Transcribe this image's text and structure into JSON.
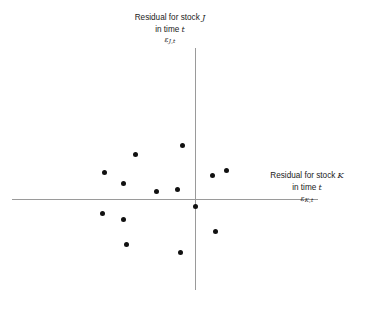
{
  "figure": {
    "type": "scatter",
    "background_color": "#ffffff",
    "axis_color": "#9a9a9a",
    "point_color": "#111111"
  },
  "y_axis": {
    "title_line1": "Residual for stock",
    "title_line1_italic": "J",
    "title_line2": "in time",
    "title_line2_italic": "t",
    "symbol": "ε",
    "symbol_subscript_stock": "J",
    "symbol_subscript_time": "t"
  },
  "x_axis": {
    "title_line1": "Residual for stock",
    "title_line1_italic": "K",
    "title_line2": "in time",
    "title_line2_italic": "t",
    "symbol": "ε",
    "symbol_subscript_stock": "K",
    "symbol_subscript_time": "t"
  },
  "chart_data": {
    "type": "scatter",
    "title": "",
    "xlabel": "Residual for stock K in time t",
    "ylabel": "Residual for stock J in time t",
    "xlim": [
      -1,
      1
    ],
    "ylim": [
      -1,
      1
    ],
    "grid": false,
    "legend": null,
    "axes_origin_px": [
      195,
      199
    ],
    "n_points": 13,
    "points_px": [
      [
        135,
        154
      ],
      [
        104,
        172
      ],
      [
        123,
        183
      ],
      [
        156,
        191
      ],
      [
        177,
        189
      ],
      [
        182,
        145
      ],
      [
        195,
        206
      ],
      [
        212,
        175
      ],
      [
        226,
        170
      ],
      [
        102,
        213
      ],
      [
        123,
        219
      ],
      [
        126,
        244
      ],
      [
        180,
        252
      ],
      [
        215,
        231
      ]
    ],
    "points": [
      {
        "x": -0.31,
        "y": 0.37
      },
      {
        "x": -0.63,
        "y": 0.22
      },
      {
        "x": -0.44,
        "y": 0.13
      },
      {
        "x": -0.16,
        "y": 0.07
      },
      {
        "x": -0.12,
        "y": 0.08
      },
      {
        "x": -0.08,
        "y": 0.45
      },
      {
        "x": 0.11,
        "y": 0.2
      },
      {
        "x": 0.25,
        "y": 0.24
      },
      {
        "x": -0.65,
        "y": -0.12
      },
      {
        "x": -0.44,
        "y": -0.17
      },
      {
        "x": -0.41,
        "y": -0.38
      },
      {
        "x": -0.06,
        "y": -0.44
      },
      {
        "x": 0.27,
        "y": -0.27
      }
    ]
  }
}
